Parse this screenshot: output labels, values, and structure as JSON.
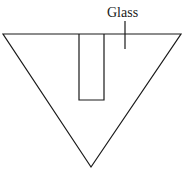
{
  "diagram": {
    "label": "Glass",
    "colors": {
      "line": "#1a1a1a",
      "background": "#ffffff"
    },
    "shapes": {
      "triangle": {
        "points": [
          [
            3,
            34
          ],
          [
            181,
            34
          ],
          [
            91,
            167
          ]
        ]
      },
      "rectangle": {
        "x": 79,
        "y": 34,
        "width": 25,
        "height": 66
      },
      "pointer": {
        "x": 125,
        "y1": 21,
        "y2": 49
      }
    }
  }
}
